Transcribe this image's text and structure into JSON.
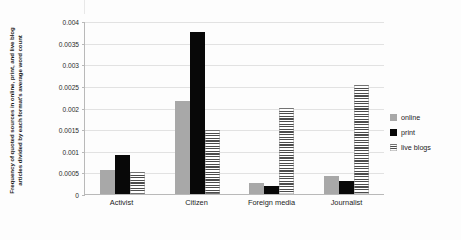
{
  "chart_data": {
    "type": "bar",
    "title": "",
    "xlabel": "",
    "ylabel": "Frequency of quoted sources in online, print, and live blog articles divided by each format's average word count",
    "categories": [
      "Activist",
      "Citizen",
      "Foreign media",
      "Journalist"
    ],
    "series": [
      {
        "name": "online",
        "values": [
          0.00055,
          0.00215,
          0.00025,
          0.00042
        ]
      },
      {
        "name": "print",
        "values": [
          0.0009,
          0.00375,
          0.00018,
          0.0003
        ]
      },
      {
        "name": "live blogs",
        "values": [
          0.00052,
          0.00148,
          0.002,
          0.00252
        ]
      }
    ],
    "ylim": [
      0,
      0.004
    ],
    "yticks": [
      0,
      0.0005,
      0.001,
      0.0015,
      0.002,
      0.0025,
      0.003,
      0.0035,
      0.004
    ],
    "ytick_labels": [
      "0",
      "0.0005",
      "0.001",
      "0.0015",
      "0.002",
      "0.0025",
      "0.003",
      "0.0035",
      "0.004"
    ],
    "grid": true,
    "legend_position": "right",
    "colors": {
      "online": "#a8a8a8",
      "print": "#080808",
      "live_blogs_hatch": "#4c4c4c",
      "gridline": "#e2e2e2",
      "axis": "#b9b9b9",
      "background": "#fdfdfd"
    }
  }
}
